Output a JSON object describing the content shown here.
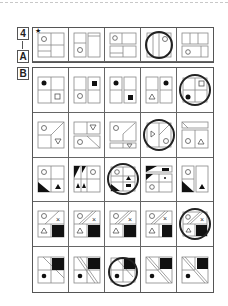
{
  "labels": {
    "problem_number": "4",
    "section_a": "A",
    "section_b": "B",
    "star": "★"
  },
  "panel_a": {
    "cells": [
      {
        "id": "a1",
        "starred": true,
        "circled": false,
        "description": "quad grid, circle top-left, bar bottom-left"
      },
      {
        "id": "a2",
        "starred": false,
        "circled": false,
        "description": "two columns, circle bottom-left"
      },
      {
        "id": "a3",
        "starred": false,
        "circled": false,
        "description": "two rows, circle top-left"
      },
      {
        "id": "a4",
        "starred": false,
        "circled": true,
        "description": "two columns, circle top-right"
      },
      {
        "id": "a5",
        "starred": false,
        "circled": false,
        "description": "three columns top, circle bottom-left"
      }
    ]
  },
  "panel_b": {
    "rows": [
      {
        "cells": [
          {
            "id": "b1-1",
            "circled": false
          },
          {
            "id": "b1-2",
            "circled": false
          },
          {
            "id": "b1-3",
            "circled": false
          },
          {
            "id": "b1-4",
            "circled": false
          },
          {
            "id": "b1-5",
            "circled": true
          }
        ]
      },
      {
        "cells": [
          {
            "id": "b2-1",
            "circled": false
          },
          {
            "id": "b2-2",
            "circled": false
          },
          {
            "id": "b2-3",
            "circled": false
          },
          {
            "id": "b2-4",
            "circled": true
          },
          {
            "id": "b2-5",
            "circled": false
          }
        ]
      },
      {
        "cells": [
          {
            "id": "b3-1",
            "circled": false
          },
          {
            "id": "b3-2",
            "circled": false
          },
          {
            "id": "b3-3",
            "circled": true
          },
          {
            "id": "b3-4",
            "circled": false
          },
          {
            "id": "b3-5",
            "circled": false
          }
        ]
      },
      {
        "cells": [
          {
            "id": "b4-1",
            "circled": false
          },
          {
            "id": "b4-2",
            "circled": false
          },
          {
            "id": "b4-3",
            "circled": false
          },
          {
            "id": "b4-4",
            "circled": false
          },
          {
            "id": "b4-5",
            "circled": true
          }
        ]
      },
      {
        "cells": [
          {
            "id": "b5-1",
            "circled": false
          },
          {
            "id": "b5-2",
            "circled": false
          },
          {
            "id": "b5-3",
            "circled": true
          },
          {
            "id": "b5-4",
            "circled": false
          },
          {
            "id": "b5-5",
            "circled": false
          }
        ]
      }
    ]
  },
  "colors": {
    "stroke": "#888888",
    "border": "#555555",
    "fill": "#111111",
    "answer_ring": "#222222"
  }
}
